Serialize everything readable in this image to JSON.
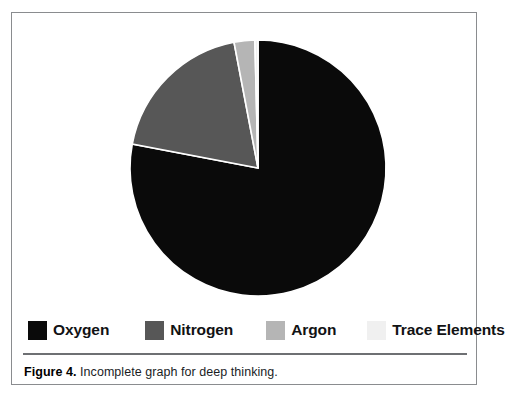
{
  "figure": {
    "caption_label": "Figure 4.",
    "caption_body": "Incomplete graph for deep thinking.",
    "border_color": "#8a8c8f",
    "background": "#ffffff"
  },
  "legend": {
    "position": "bottom",
    "items": [
      {
        "label": "Oxygen",
        "color": "#0a0a0a",
        "icon": "legend-swatch-icon"
      },
      {
        "label": "Nitrogen",
        "color": "#575757",
        "icon": "legend-swatch-icon"
      },
      {
        "label": "Argon",
        "color": "#b5b5b5",
        "icon": "legend-swatch-icon"
      },
      {
        "label": "Trace Elements",
        "color": "#f0f0f0",
        "icon": "legend-swatch-icon"
      }
    ]
  },
  "chart_data": {
    "type": "pie",
    "title": "",
    "subtitle": "",
    "xlabel": "",
    "ylabel": "",
    "grid": false,
    "legend_position": "bottom",
    "start_angle_deg": 0,
    "direction": "clockwise",
    "center": {
      "x": 246,
      "y": 155
    },
    "radius": 128,
    "slice_separator_color": "#ffffff",
    "categories": [
      "Oxygen",
      "Nitrogen",
      "Argon",
      "Trace Elements"
    ],
    "values": [
      78.0,
      19.0,
      2.6,
      0.4
    ],
    "units": "percent",
    "colors": [
      "#0a0a0a",
      "#575757",
      "#b5b5b5",
      "#f0f0f0"
    ],
    "slices": [
      {
        "name": "Oxygen",
        "value": 78.0,
        "color": "#0a0a0a",
        "start_deg": 0,
        "end_deg": 280.8
      },
      {
        "name": "Nitrogen",
        "value": 19.0,
        "color": "#575757",
        "start_deg": 280.8,
        "end_deg": 349.2
      },
      {
        "name": "Argon",
        "value": 2.6,
        "color": "#b5b5b5",
        "start_deg": 349.2,
        "end_deg": 358.6
      },
      {
        "name": "Trace Elements",
        "value": 0.4,
        "color": "#f0f0f0",
        "start_deg": 358.6,
        "end_deg": 360
      }
    ]
  }
}
